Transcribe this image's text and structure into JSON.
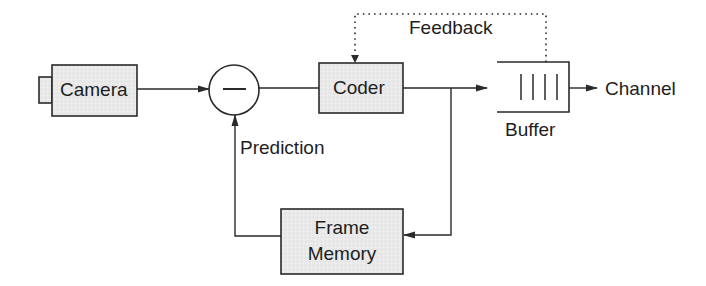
{
  "blocks": {
    "camera": {
      "label": "Camera"
    },
    "subtractor": {
      "symbol": "—"
    },
    "coder": {
      "label": "Coder"
    },
    "buffer": {
      "label": "Buffer"
    },
    "frame_memory": {
      "label_line1": "Frame",
      "label_line2": "Memory"
    }
  },
  "labels": {
    "feedback": "Feedback",
    "prediction": "Prediction",
    "channel": "Channel"
  },
  "colors": {
    "block_fill": "#e9e9e9",
    "stroke": "#2a2a2a",
    "text": "#1e1e1e",
    "background": "#ffffff"
  }
}
